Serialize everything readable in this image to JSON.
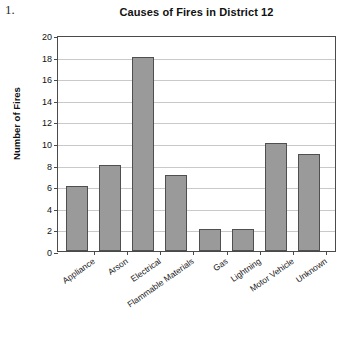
{
  "item_number": "1.",
  "chart_data": {
    "type": "bar",
    "title": "Causes of Fires in District 12",
    "xlabel": "",
    "ylabel": "Number of Fires",
    "categories": [
      "Appliance",
      "Arson",
      "Electrical",
      "Flammable Materials",
      "Gas",
      "Lightning",
      "Motor Vehicle",
      "Unknown"
    ],
    "values": [
      6,
      8,
      18,
      7,
      2,
      2,
      10,
      9
    ],
    "ylim": [
      0,
      20
    ],
    "ytick_step": 2,
    "yticks": [
      0,
      2,
      4,
      6,
      8,
      10,
      12,
      14,
      16,
      18,
      20
    ],
    "ytick_labels": [
      "0",
      "2",
      "4",
      "6",
      "8",
      "10",
      "12",
      "14",
      "16",
      "18",
      "20"
    ],
    "grid": true,
    "legend": false,
    "bar_color": "#9a9a9a",
    "bar_border_color": "#4f4f4f",
    "axis_color": "#4a4a4a",
    "grid_color": "#c9c9c9",
    "background": "#ffffff"
  }
}
